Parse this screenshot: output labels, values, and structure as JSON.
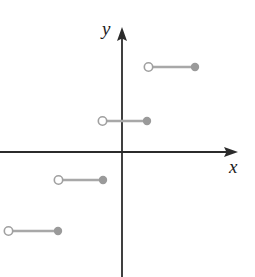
{
  "figure": {
    "width": 255,
    "height": 277,
    "background": "#ffffff",
    "type": "cartesian-plot"
  },
  "axes": {
    "origin": {
      "x": 122,
      "y": 152
    },
    "color": "#2b2b2b",
    "stroke_width": 1.8,
    "x_axis": {
      "label": "x",
      "start": {
        "x": 0,
        "y": 152
      },
      "end": {
        "x": 238,
        "y": 152
      },
      "arrow": "right",
      "label_position": {
        "x": 229,
        "y": 157
      }
    },
    "y_axis": {
      "label": "y",
      "start": {
        "x": 122,
        "y": 277
      },
      "end": {
        "x": 122,
        "y": 27
      },
      "arrow": "up",
      "label_position": {
        "x": 102,
        "y": 19
      }
    }
  },
  "style": {
    "segment_color": "#a8a8a8",
    "segment_width": 2.6,
    "open_dot_fill": "#ffffff",
    "open_dot_stroke": "#a0a0a0",
    "open_dot_stroke_width": 1.6,
    "closed_dot_fill": "#9a9a9a",
    "dot_radius": 4.2
  },
  "chart_data": {
    "type": "line",
    "title": "",
    "subtitle": "",
    "xlabel": "x",
    "ylabel": "y",
    "grid": false,
    "legend": null,
    "origin_px": {
      "x": 122,
      "y": 152
    },
    "segments": [
      {
        "name": "segment-1",
        "y_px": 231,
        "x_start_px": 8,
        "x_end_px": 58,
        "left_endpoint": "open",
        "right_endpoint": "closed"
      },
      {
        "name": "segment-2",
        "y_px": 180,
        "x_start_px": 58,
        "x_end_px": 103,
        "left_endpoint": "open",
        "right_endpoint": "closed"
      },
      {
        "name": "segment-3",
        "y_px": 121,
        "x_start_px": 102,
        "x_end_px": 147,
        "left_endpoint": "open",
        "right_endpoint": "closed"
      },
      {
        "name": "segment-4",
        "y_px": 67,
        "x_start_px": 148,
        "x_end_px": 195,
        "left_endpoint": "open",
        "right_endpoint": "closed"
      }
    ]
  }
}
